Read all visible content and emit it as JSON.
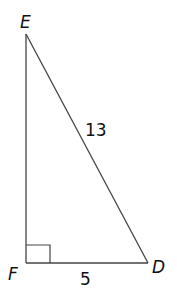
{
  "diagram": {
    "type": "right-triangle",
    "vertices": {
      "E": {
        "label": "E",
        "x": 26,
        "y": 34
      },
      "F": {
        "label": "F",
        "x": 26,
        "y": 263
      },
      "D": {
        "label": "D",
        "x": 148,
        "y": 263
      }
    },
    "right_angle_at": "F",
    "sides": {
      "ED": {
        "label": "13"
      },
      "FD": {
        "label": "5"
      },
      "EF": {
        "label": ""
      }
    },
    "stroke_color": "#444444",
    "text_color": "#111111"
  }
}
